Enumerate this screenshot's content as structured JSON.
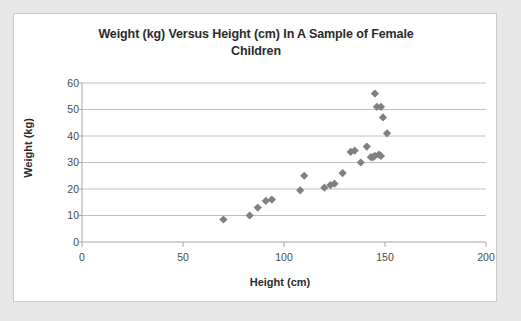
{
  "chart_data": {
    "type": "scatter",
    "title": "Weight (kg) Versus Height (cm) In A Sample of Female Children",
    "title_line1": "Weight (kg) Versus Height (cm) In A Sample of Female",
    "title_line2": "Children",
    "xlabel": "Height (cm)",
    "ylabel": "Weight (kg)",
    "xlim": [
      0,
      200
    ],
    "ylim": [
      0,
      60
    ],
    "xticks": [
      0,
      50,
      100,
      150,
      200
    ],
    "yticks": [
      0,
      10,
      20,
      30,
      40,
      50,
      60
    ],
    "grid": "horizontal",
    "legend": "none",
    "marker": "diamond",
    "marker_color": "#808080",
    "series": [
      {
        "name": "Female children",
        "points": [
          [
            70,
            8.5
          ],
          [
            83,
            10
          ],
          [
            87,
            13
          ],
          [
            91,
            15.5
          ],
          [
            94,
            16
          ],
          [
            110,
            25
          ],
          [
            108,
            19.5
          ],
          [
            120,
            20.5
          ],
          [
            123,
            21.5
          ],
          [
            125,
            22
          ],
          [
            129,
            26
          ],
          [
            133,
            34
          ],
          [
            135,
            34.5
          ],
          [
            138,
            30
          ],
          [
            141,
            36
          ],
          [
            143,
            32
          ],
          [
            144,
            32
          ],
          [
            145,
            32.5
          ],
          [
            147,
            33
          ],
          [
            148,
            32.5
          ],
          [
            145,
            56
          ],
          [
            146,
            51
          ],
          [
            148,
            51
          ],
          [
            149,
            47
          ],
          [
            151,
            41
          ]
        ]
      }
    ]
  },
  "axis": {
    "y_tick_labels": [
      "60",
      "50",
      "40",
      "30",
      "20",
      "10",
      "0"
    ],
    "x_tick_labels": [
      "0",
      "50",
      "100",
      "150",
      "200"
    ]
  }
}
